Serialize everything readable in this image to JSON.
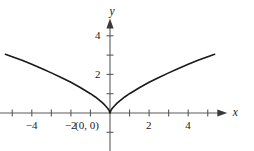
{
  "chart_data": {
    "type": "line",
    "title": "",
    "subtitle": "",
    "xlabel": "x",
    "ylabel": "y",
    "xlim": [
      -5.8,
      6.0
    ],
    "ylim": [
      -2.6,
      4.9
    ],
    "grid": false,
    "legend": null,
    "axis_style": "arrowed-cartesian",
    "x_ticks": [
      -5,
      -4,
      -3,
      -2,
      -1,
      1,
      2,
      3,
      4,
      5
    ],
    "x_tick_labels": [
      {
        "value": -4,
        "text": "−4"
      },
      {
        "value": -2,
        "text": "−2"
      },
      {
        "value": 2,
        "text": "2"
      },
      {
        "value": 4,
        "text": "4"
      }
    ],
    "y_ticks": [
      -2,
      -1,
      1,
      2,
      3,
      4
    ],
    "y_tick_labels": [
      {
        "value": 2,
        "text": "2"
      },
      {
        "value": 4,
        "text": "4"
      }
    ],
    "annotations": [
      {
        "text": "(0, 0)",
        "x": 0,
        "y": 0,
        "placement": "below-left"
      }
    ],
    "series": [
      {
        "name": "y = |x|^(2/3)",
        "color": "#1a1a1a",
        "linewidth": 1.6,
        "x": [
          -5.35,
          -5.0,
          -4.5,
          -4.0,
          -3.5,
          -3.0,
          -2.5,
          -2.0,
          -1.5,
          -1.0,
          -0.75,
          -0.5,
          -0.35,
          -0.2,
          -0.1,
          -0.04,
          0.0,
          0.04,
          0.1,
          0.2,
          0.35,
          0.5,
          0.75,
          1.0,
          1.5,
          2.0,
          2.5,
          3.0,
          3.5,
          4.0,
          4.5,
          5.0,
          5.35
        ],
        "y": [
          3.04,
          2.92,
          2.73,
          2.52,
          2.31,
          2.08,
          1.84,
          1.59,
          1.31,
          1.0,
          0.83,
          0.63,
          0.5,
          0.34,
          0.22,
          0.12,
          0.0,
          0.12,
          0.22,
          0.34,
          0.5,
          0.63,
          0.83,
          1.0,
          1.31,
          1.59,
          1.84,
          2.08,
          2.31,
          2.52,
          2.73,
          2.92,
          3.04
        ]
      }
    ]
  },
  "axes": {
    "x_axis_label": "x",
    "y_axis_label": "y"
  },
  "labels": {
    "x_neg4": "−4",
    "x_neg2": "−2",
    "x_pos2": "2",
    "x_pos4": "4",
    "y_pos2": "2",
    "y_pos4": "4",
    "origin": "(0, 0)"
  },
  "colors": {
    "curve": "#1a1a1a",
    "axis": "#5a5a5a",
    "text": "#1a1a1a",
    "background": "#ffffff"
  }
}
